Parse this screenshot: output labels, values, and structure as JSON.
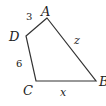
{
  "figure": {
    "type": "quadrilateral",
    "vertices": [
      {
        "name": "A",
        "x": 47,
        "y": 18
      },
      {
        "name": "D",
        "x": 26,
        "y": 36
      },
      {
        "name": "C",
        "x": 36,
        "y": 81
      },
      {
        "name": "B",
        "x": 96,
        "y": 81
      }
    ],
    "vertex_labels": {
      "A": "A",
      "D": "D",
      "C": "C",
      "B": "B"
    },
    "side_labels": {
      "AD": "3",
      "DC": "6",
      "AB": "z",
      "CB": "x"
    },
    "colors": {
      "stroke": "#333333",
      "text": "#222222",
      "background": "#ffffff"
    }
  }
}
